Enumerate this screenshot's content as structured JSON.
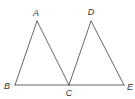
{
  "figure": {
    "points": {
      "A": {
        "x": 37,
        "y": 21,
        "label": "A",
        "lx": 36,
        "ly": 16
      },
      "B": {
        "x": 15,
        "y": 85,
        "label": "B",
        "lx": 7,
        "ly": 89
      },
      "C": {
        "x": 69,
        "y": 85,
        "label": "C",
        "lx": 69,
        "ly": 96
      },
      "D": {
        "x": 91,
        "y": 21,
        "label": "D",
        "lx": 91,
        "ly": 15
      },
      "E": {
        "x": 124,
        "y": 85,
        "label": "E",
        "lx": 130,
        "ly": 90
      }
    },
    "segments": [
      [
        "A",
        "B"
      ],
      [
        "A",
        "C"
      ],
      [
        "B",
        "C"
      ],
      [
        "D",
        "C"
      ],
      [
        "D",
        "E"
      ],
      [
        "C",
        "E"
      ]
    ],
    "stroke_color": "#555555",
    "label_color": "#333333"
  }
}
